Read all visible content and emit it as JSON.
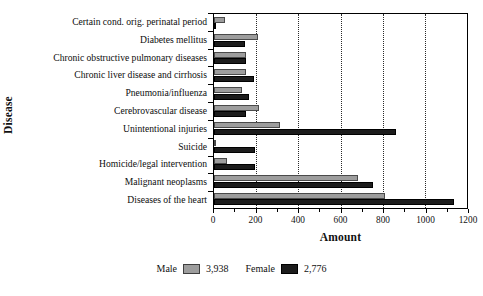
{
  "chart_data": {
    "type": "bar",
    "orientation": "horizontal",
    "title": "",
    "xlabel": "Amount",
    "ylabel": "Disease",
    "xlim": [
      0,
      1200
    ],
    "xticks": [
      0,
      200,
      400,
      600,
      800,
      1000,
      1200
    ],
    "xtick_labels": [
      "0",
      "200",
      "400",
      "600",
      "800",
      "1000",
      "1200"
    ],
    "grid": "vertical-dotted",
    "legend_position": "bottom-center",
    "categories": [
      "Certain cond. orig. perinatal period",
      "Diabetes mellitus",
      "Chronic obstructive pulmonary diseases",
      "Chronic liver disease and cirrhosis",
      "Pneumonia/influenza",
      "Cerebrovascular disease",
      "Unintentional injuries",
      "Suicide",
      "Homicide/legal intervention",
      "Malignant neoplasms",
      "Diseases of the heart"
    ],
    "series": [
      {
        "name": "Male",
        "color": "#9d9d9d",
        "total": "3,938",
        "values": [
          52,
          207,
          150,
          152,
          135,
          215,
          315,
          4,
          62,
          685,
          810
        ]
      },
      {
        "name": "Female",
        "color": "#1c1c1c",
        "total": "2,776",
        "values": [
          0,
          145,
          153,
          190,
          168,
          150,
          865,
          195,
          195,
          755,
          1140
        ]
      }
    ]
  },
  "axes": {
    "x_title": "Amount",
    "y_title": "Disease"
  },
  "legend": {
    "male_label": "Male",
    "male_value": "3,938",
    "female_label": "Female",
    "female_value": "2,776"
  }
}
